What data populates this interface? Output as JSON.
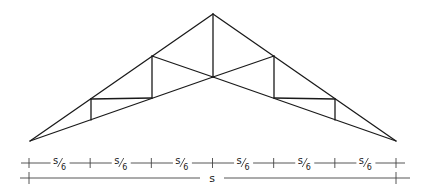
{
  "diagram": {
    "type": "scissors-truss",
    "colors": {
      "members": "#1a1a1a",
      "dimensions": "#444444",
      "background": "#ffffff"
    },
    "joints": {
      "apex": [
        213,
        14
      ],
      "left_support": [
        30,
        141
      ],
      "right_support": [
        396,
        141
      ],
      "center_bottom": [
        213,
        77
      ],
      "L1_top": [
        91,
        99
      ],
      "L1_bot": [
        91,
        120
      ],
      "L2_top": [
        152,
        56
      ],
      "L2_bot": [
        152,
        98
      ],
      "R2_top": [
        274,
        56
      ],
      "R2_bot": [
        274,
        98
      ],
      "R1_top": [
        335,
        99
      ],
      "R1_bot": [
        335,
        120
      ]
    },
    "panel_dimension": {
      "label_numerator": "s",
      "label_denominator": "6",
      "count": 6
    },
    "span_dimension": {
      "label": "s"
    }
  }
}
